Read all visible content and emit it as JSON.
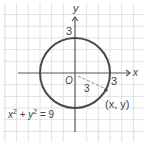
{
  "diagram": {
    "type": "circle-on-coordinate-grid",
    "axes": {
      "x_label": "x",
      "y_label": "y",
      "origin_label": "O"
    },
    "ticks": {
      "x_tick": "3",
      "y_tick": "3"
    },
    "radius_label": "3",
    "point_label": "(x, y)",
    "equation": {
      "base1": "x",
      "exp1": "2",
      "plus": " + ",
      "base2": "y",
      "exp2": "2",
      "equals": " = 9"
    },
    "colors": {
      "grid": "#d8d8d8",
      "circle": "#4a4a4a",
      "axis": "#555555",
      "radius": "#888888"
    }
  }
}
